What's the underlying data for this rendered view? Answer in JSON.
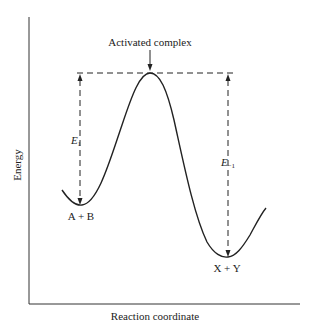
{
  "diagram": {
    "title_annotation": "Activated complex",
    "x_axis_label": "Reaction coordinate",
    "y_axis_label": "Energy",
    "reactants_label": "A + B",
    "products_label": "X + Y",
    "forward_energy_label": "E",
    "forward_energy_subscript": "1",
    "reverse_energy_label": "E",
    "reverse_energy_subscript": "−1",
    "colors": {
      "line": "#222222",
      "background": "#ffffff"
    }
  }
}
